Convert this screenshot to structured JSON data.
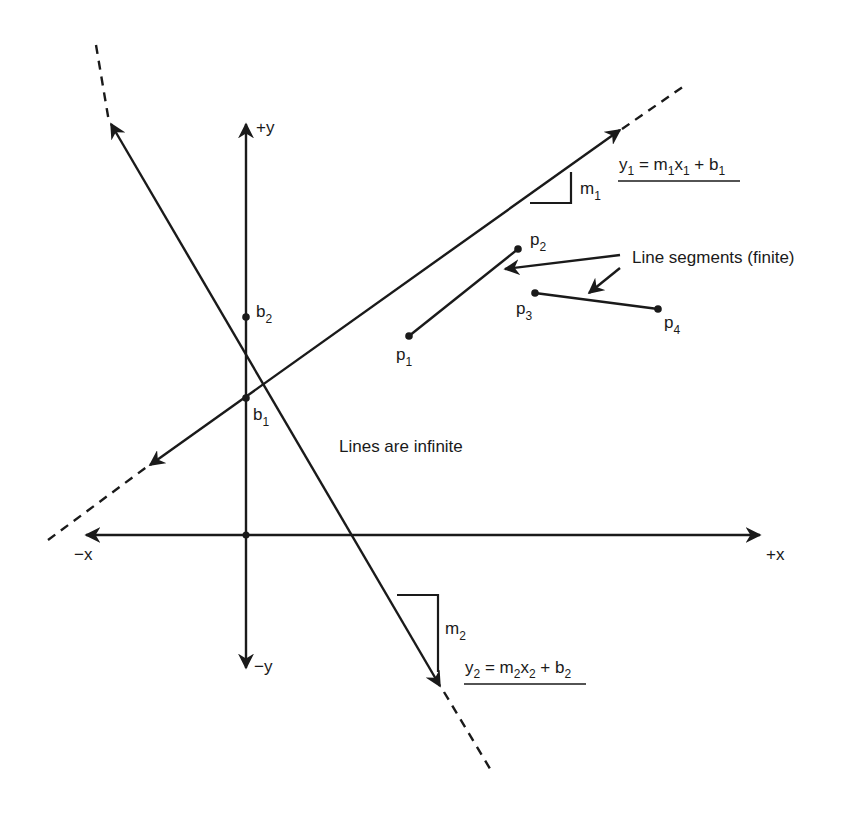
{
  "diagram": {
    "axes": {
      "x_pos_label": "+x",
      "x_neg_label": "−x",
      "y_pos_label": "+y",
      "y_neg_label": "−y"
    },
    "line1": {
      "equation": {
        "y": "y",
        "ys": "1",
        "eq": " = m",
        "ms": "1",
        "x": "x",
        "xs": "1",
        "plus": " + b",
        "bs": "1"
      },
      "slope_label": {
        "base": "m",
        "sub": "1"
      },
      "intercept_label": {
        "base": "b",
        "sub": "1"
      }
    },
    "line2": {
      "equation": {
        "y": "y",
        "ys": "2",
        "eq": " = m",
        "ms": "2",
        "x": "x",
        "xs": "2",
        "plus": " + b",
        "bs": "2"
      },
      "slope_label": {
        "base": "m",
        "sub": "2"
      },
      "intercept_label": {
        "base": "b",
        "sub": "2"
      }
    },
    "segments": {
      "caption": "Line segments (finite)",
      "points": [
        {
          "base": "p",
          "sub": "1"
        },
        {
          "base": "p",
          "sub": "2"
        },
        {
          "base": "p",
          "sub": "3"
        },
        {
          "base": "p",
          "sub": "4"
        }
      ]
    },
    "lines_caption": "Lines are infinite",
    "colors": {
      "ink": "#1a1a1a",
      "background": "#ffffff"
    }
  }
}
